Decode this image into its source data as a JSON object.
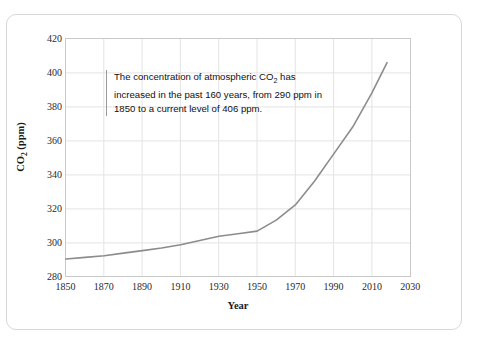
{
  "chart_data": {
    "type": "line",
    "title": "",
    "xlabel": "Year",
    "ylabel": "CO₂ (ppm)",
    "xlim": [
      1850,
      2030
    ],
    "ylim": [
      280,
      420
    ],
    "xticks": [
      1850,
      1870,
      1890,
      1910,
      1930,
      1950,
      1970,
      1990,
      2010,
      2030
    ],
    "yticks": [
      280,
      300,
      320,
      340,
      360,
      380,
      400,
      420
    ],
    "grid": true,
    "legend": "none",
    "series": [
      {
        "name": "Atmospheric CO2 concentration",
        "color": "#8c8c8c",
        "x": [
          1850,
          1860,
          1870,
          1880,
          1890,
          1900,
          1910,
          1920,
          1930,
          1940,
          1950,
          1960,
          1970,
          1980,
          1990,
          2000,
          2010,
          2018
        ],
        "values": [
          290,
          291,
          292,
          293.5,
          295,
          296.5,
          298.5,
          301,
          303.5,
          305,
          306.5,
          313,
          322,
          336,
          352,
          368,
          388,
          406
        ]
      }
    ],
    "annotations": [
      {
        "name": "co2-summary-note",
        "text_line_1": "The concentration of atmospheric CO",
        "text_subscript_1": "2",
        "text_line_1_end": " has",
        "text_line_2": "increased in the past 160 years, from 290",
        "text_line_3": "ppm in 1850 to a current level of 406 ppm.",
        "rule_color": "#9a9a9a"
      }
    ],
    "axis_titles": {
      "x": "Year",
      "y_prefix": "CO",
      "y_subscript": "2",
      "y_suffix": " (ppm)"
    },
    "colors": {
      "line": "#8c8c8c",
      "grid": "#e2e2e2",
      "frame": "#c9c9c9",
      "card_border": "#d8d8d8",
      "text": "#1a1a1a",
      "background": "#ffffff"
    }
  }
}
